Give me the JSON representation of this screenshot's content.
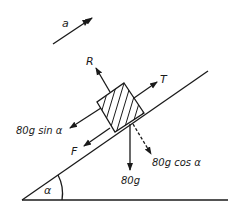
{
  "diagram": {
    "labels": {
      "acceleration": "a",
      "reaction": "R",
      "tension": "T",
      "weight_component_parallel": "80g sin α",
      "friction": "F",
      "weight_component_perpendicular": "80g cos α",
      "weight": "80g",
      "angle": "α"
    },
    "colors": {
      "stroke": "#1a1a1a",
      "background": "#ffffff"
    }
  }
}
